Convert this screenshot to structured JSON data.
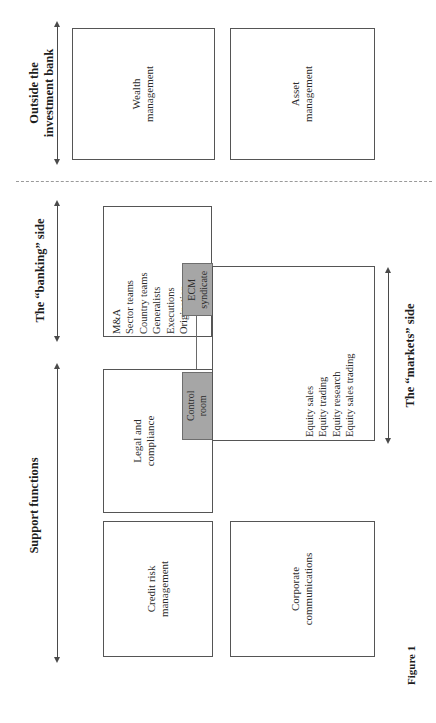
{
  "figure": {
    "caption": "Figure 1"
  },
  "sections": [
    {
      "id": "outside",
      "label_line1": "Outside the",
      "label_line2": "investment bank"
    },
    {
      "id": "banking",
      "label_line1": "The “banking” side",
      "label_line2": ""
    },
    {
      "id": "support",
      "label_line1": "Support functions",
      "label_line2": ""
    },
    {
      "id": "markets",
      "label_line1": "The “markets” side",
      "label_line2": ""
    }
  ],
  "boxes": {
    "wealth": {
      "line1": "Wealth",
      "line2": "management"
    },
    "asset": {
      "line1": "Asset",
      "line2": "management"
    },
    "banking": {
      "items": [
        "M&A",
        "Sector teams",
        "Country teams",
        "Generalists",
        "Executions",
        "Origination"
      ]
    },
    "ecm_syndicate": {
      "line1": "ECM",
      "line2": "syndicate"
    },
    "legal": {
      "line1": "Legal and",
      "line2": "compliance"
    },
    "control_room": {
      "line1": "Control",
      "line2": "room"
    },
    "markets": {
      "items": [
        "Equity sales",
        "Equity trading",
        "Equity research",
        "Equity sales trading"
      ]
    },
    "credit": {
      "line1": "Credit risk",
      "line2": "management"
    },
    "corpcomms": {
      "line1": "Corporate",
      "line2": "communications"
    }
  },
  "colors": {
    "highlight_fill": "#a6a6a6",
    "box_border": "#555555",
    "divider": "#9a9a9a",
    "text": "#2b2b2b"
  }
}
